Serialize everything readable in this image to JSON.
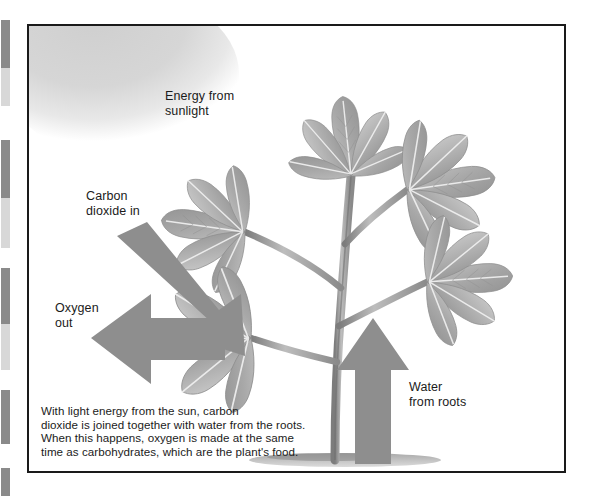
{
  "figure": {
    "frame_color": "#1a1a1a",
    "background_color": "#ffffff",
    "arrow_color": "#8e8e8e",
    "plant_color": "#a9a9a9",
    "sun_color": "#d9d9d9"
  },
  "labels": {
    "energy": {
      "line1": "Energy from",
      "line2": "sunlight"
    },
    "carbon": {
      "line1": "Carbon",
      "line2": "dioxide in"
    },
    "oxygen": {
      "line1": "Oxygen",
      "line2": "out"
    },
    "water": {
      "line1": "Water",
      "line2": "from roots"
    }
  },
  "caption": {
    "line1": "With light energy from the sun, carbon",
    "line2": "dioxide is joined together with water from the roots.",
    "line3": "When this happens, oxygen is made at the same",
    "line4": "time as carbohydrates, which are the plant's food."
  },
  "margin_marks": [
    {
      "top": 20,
      "height": 48,
      "tone": "dark"
    },
    {
      "top": 68,
      "height": 38,
      "tone": "light"
    },
    {
      "top": 140,
      "height": 58,
      "tone": "dark"
    },
    {
      "top": 198,
      "height": 50,
      "tone": "light"
    },
    {
      "top": 268,
      "height": 56,
      "tone": "dark"
    },
    {
      "top": 324,
      "height": 46,
      "tone": "light"
    },
    {
      "top": 390,
      "height": 54,
      "tone": "dark"
    },
    {
      "top": 468,
      "height": 28,
      "tone": "dark"
    }
  ],
  "icons": {
    "sun": "sun-glow-icon",
    "arrow_co2": "bent-arrow-down-right-icon",
    "arrow_oxygen": "arrow-left-icon",
    "arrow_water": "arrow-up-icon",
    "plant": "plant-illustration-icon"
  }
}
